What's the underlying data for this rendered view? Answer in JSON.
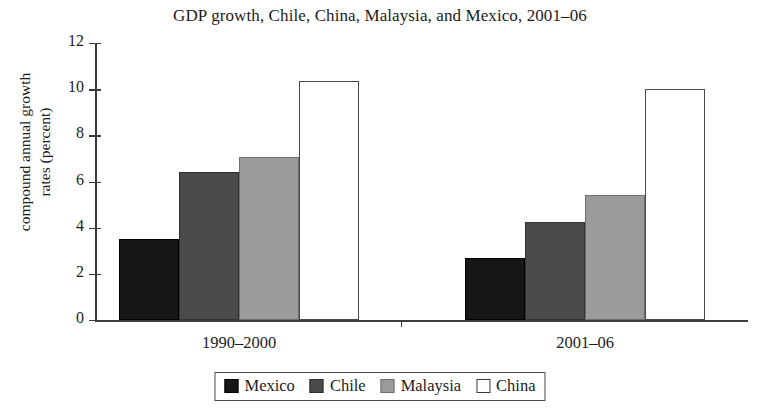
{
  "chart_data": {
    "type": "bar",
    "title": "GDP growth, Chile, China, Malaysia, and Mexico, 2001–06",
    "xlabel": "",
    "ylabel": "compound annual growth rates (percent)",
    "ylabel_lines": [
      "compound annual growth",
      "rates (percent)"
    ],
    "categories": [
      "1990–2000",
      "2001–06"
    ],
    "series": [
      {
        "name": "Mexico",
        "values": [
          3.5,
          2.7
        ],
        "color": "#161616"
      },
      {
        "name": "Chile",
        "values": [
          6.4,
          4.25
        ],
        "color": "#4b4b4b"
      },
      {
        "name": "Malaysia",
        "values": [
          7.05,
          5.4
        ],
        "color": "#9b9b9b"
      },
      {
        "name": "China",
        "values": [
          10.35,
          10.0
        ],
        "color": "#ffffff"
      }
    ],
    "ylim": [
      0,
      12
    ],
    "yticks": [
      0,
      2,
      4,
      6,
      8,
      10,
      12
    ],
    "ytick_labels": [
      "0",
      "2",
      "4",
      "6",
      "8",
      "10",
      "12"
    ],
    "grid": false,
    "legend_position": "bottom-center",
    "legend_entries": [
      "Mexico",
      "Chile",
      "Malaysia",
      "China"
    ]
  }
}
